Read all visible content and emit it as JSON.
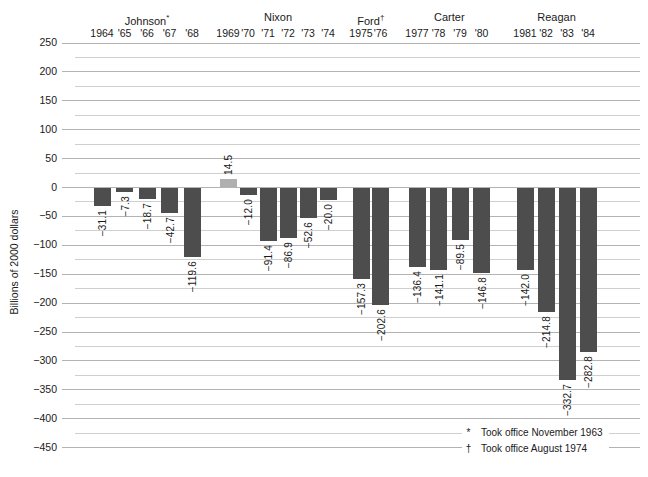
{
  "chart_data": {
    "type": "bar",
    "title": "",
    "ylabel": "Billions of 2000 dollars",
    "ylim": [
      -450,
      250
    ],
    "y_major_step": 50,
    "y_minor_step": 25,
    "grid": "on",
    "y_tick_labels": [
      "250",
      "200",
      "150",
      "100",
      "50",
      "0",
      "−50",
      "−100",
      "−150",
      "−200",
      "−250",
      "−300",
      "−350",
      "−400",
      "−450"
    ],
    "colors": {
      "deficit_bar": "#4d4d4d",
      "surplus_bar": "#b0b0b0",
      "major_gridline": "#b3b3b3",
      "minor_gridline": "#cfcfcf",
      "text": "#1a1a1a"
    },
    "groups": [
      {
        "president": "Johnson",
        "mark": "*",
        "years": [
          "1964",
          "'65",
          "'66",
          "'67",
          "'68"
        ],
        "values": [
          -31.1,
          -7.3,
          -18.7,
          -42.7,
          -119.6
        ],
        "labels": [
          "−31.1",
          "−7.3",
          "−18.7",
          "−42.7",
          "−119.6"
        ]
      },
      {
        "president": "Nixon",
        "mark": "",
        "years": [
          "1969",
          "'70",
          "'71",
          "'72",
          "'73",
          "'74"
        ],
        "values": [
          14.5,
          -12.0,
          -91.4,
          -86.9,
          -52.6,
          -20.0
        ],
        "labels": [
          "14.5",
          "−12.0",
          "−91.4",
          "−86.9",
          "−52.6",
          "−20.0"
        ]
      },
      {
        "president": "Ford",
        "mark": "†",
        "years": [
          "1975",
          "'76"
        ],
        "values": [
          -157.3,
          -202.6
        ],
        "labels": [
          "−157.3",
          "−202.6"
        ]
      },
      {
        "president": "Carter",
        "mark": "",
        "years": [
          "1977",
          "'78",
          "'79",
          "'80"
        ],
        "values": [
          -136.4,
          -141.1,
          -89.5,
          -146.8
        ],
        "labels": [
          "−136.4",
          "−141.1",
          "−89.5",
          "−146.8"
        ]
      },
      {
        "president": "Reagan",
        "mark": "",
        "years": [
          "1981",
          "'82",
          "'83",
          "'84"
        ],
        "values": [
          -142.0,
          -214.8,
          -332.7,
          -282.8
        ],
        "labels": [
          "−142.0",
          "−214.8",
          "−332.7",
          "−282.8"
        ]
      }
    ]
  },
  "footnotes": [
    {
      "mark": "*",
      "text": "Took office November 1963"
    },
    {
      "mark": "†",
      "text": "Took office August 1974"
    }
  ]
}
